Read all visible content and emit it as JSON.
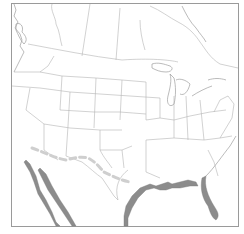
{
  "map": {
    "title": "",
    "region": "North America (United States, southern Canada, northern Mexico)",
    "style": "outline basemap",
    "colors": {
      "background": "#ffffff",
      "frame": "#9a9a9a",
      "borders": "#b4b4b4",
      "highlighted_coast": "#8c8c8c",
      "dashed_route": "#cfcfcf"
    },
    "features": {
      "highlighted_coastlines": [
        "Gulf of California coast",
        "Baja California Pacific coast",
        "Gulf of Mexico coast",
        "Florida coast"
      ],
      "dashed_line": "Approximate US–Mexico border corridor, dashed light gray"
    }
  }
}
